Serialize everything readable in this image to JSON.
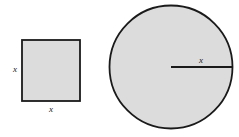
{
  "figure": {
    "background_color": "#ffffff",
    "width": 239,
    "height": 137,
    "shape_fill_color": "#dcdcdc",
    "shape_stroke_color": "#1a1a1a",
    "label_color": "#1a1a1a"
  },
  "square": {
    "name": "square",
    "x": 22,
    "y": 40,
    "width": 58,
    "height": 61,
    "stroke_width": 1.8,
    "labels": {
      "left": {
        "text": "x",
        "x": 15,
        "y": 72
      },
      "bottom": {
        "text": "x",
        "x": 51,
        "y": 112
      }
    }
  },
  "circle": {
    "name": "circle",
    "center_x": 171,
    "center_y": 67,
    "radius": 61.5,
    "stroke_width": 1.8,
    "radius_line": {
      "name": "radius-line",
      "x1": 171,
      "y1": 67,
      "x2": 232,
      "y2": 67,
      "stroke_width": 1.8
    },
    "labels": {
      "radius": {
        "text": "x",
        "x": 201,
        "y": 63
      }
    }
  }
}
